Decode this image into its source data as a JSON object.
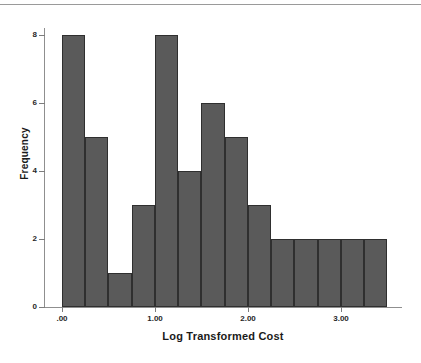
{
  "chart_data": {
    "type": "bar",
    "title": "",
    "subtitle": "",
    "xlabel": "Log Transformed Cost",
    "ylabel": "Frequency",
    "xlim": [
      -0.05,
      3.45
    ],
    "ylim": [
      0,
      8
    ],
    "grid": false,
    "legend": null,
    "bin_width": 0.25,
    "bin_starts": [
      0.0,
      0.25,
      0.5,
      0.75,
      1.0,
      1.25,
      1.5,
      1.75,
      2.0,
      2.25,
      2.5,
      2.75,
      3.0,
      3.25
    ],
    "categories": [
      "0.00-0.25",
      "0.25-0.50",
      "0.50-0.75",
      "0.75-1.00",
      "1.00-1.25",
      "1.25-1.50",
      "1.50-1.75",
      "1.75-2.00",
      "2.00-2.25",
      "2.25-2.50",
      "2.50-2.75",
      "2.75-3.00",
      "3.00-3.25",
      "3.25-3.50"
    ],
    "values": [
      8,
      5,
      1,
      3,
      8,
      4,
      6,
      5,
      3,
      2,
      2,
      2,
      2,
      2
    ],
    "x_ticks": [
      0,
      1,
      2,
      3
    ],
    "x_tick_labels": [
      ".00",
      "1.00",
      "2.00",
      "3.00"
    ],
    "y_ticks": [
      0,
      2,
      4,
      6,
      8
    ],
    "y_tick_labels": [
      "0",
      "2",
      "4",
      "6",
      "8"
    ],
    "bar_color": "#5a5a5a",
    "bar_edge_color": "#2f2f2f",
    "axis_color": "#8f8f8f",
    "background": "#ffffff",
    "total_count": 53
  }
}
